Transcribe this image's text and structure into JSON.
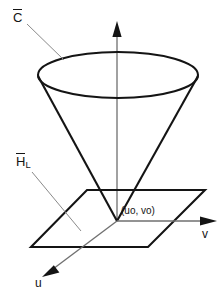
{
  "figure": {
    "background_color": "#ffffff",
    "stroke_color": "#141414",
    "leader_color": "#8a8a8a"
  },
  "labels": {
    "cone": {
      "text": "C",
      "accent": "overbar",
      "display": "C̄",
      "x": 14,
      "y": 12
    },
    "plane": {
      "text": "H",
      "accent": "overbar",
      "subscript": "L",
      "display": "H̄L",
      "x": 17,
      "y": 156
    },
    "origin_point": {
      "text": "(uo, vo)",
      "x": 121,
      "y": 212
    },
    "axis_v": {
      "text": "v",
      "x": 203,
      "y": 235
    },
    "axis_u": {
      "text": "u",
      "x": 36,
      "y": 283
    }
  },
  "geometry": {
    "vertical_axis": {
      "x": 117,
      "y_top": 22,
      "y_bottom": 221,
      "arrow": "up"
    },
    "v_axis": {
      "x_start": 117,
      "y": 221,
      "x_end": 216,
      "arrow": "right"
    },
    "u_axis": {
      "x_start": 117,
      "y_start": 221,
      "x_end": 42,
      "y_end": 277,
      "arrow": "down-left"
    },
    "cone_ellipse": {
      "cx": 118,
      "cy": 75,
      "rx": 80,
      "ry": 23
    },
    "cone_apex": {
      "x": 117,
      "y": 221
    },
    "plane_corners": [
      {
        "x": 87,
        "y": 190
      },
      {
        "x": 205,
        "y": 190
      },
      {
        "x": 148,
        "y": 247
      },
      {
        "x": 31,
        "y": 247
      }
    ],
    "leader_cone": {
      "x1": 26,
      "y1": 23,
      "x2": 63,
      "y2": 60
    },
    "leader_plane": {
      "x1": 31,
      "y1": 171,
      "x2": 80,
      "y2": 230
    }
  },
  "icons": {
    "arrow_up": "arrow-up-icon",
    "arrow_right": "arrow-right-icon",
    "arrow_down_left": "arrow-down-left-icon"
  }
}
